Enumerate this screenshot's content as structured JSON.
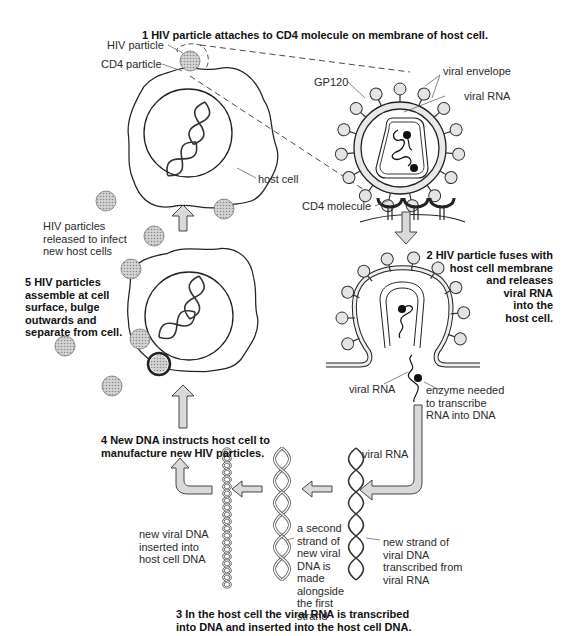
{
  "diagram": {
    "steps": {
      "s1": "1   HIV particle attaches to CD4 molecule on membrane of host cell.",
      "s2": [
        "2   HIV particle fuses with",
        "host cell membrane",
        "and releases",
        "viral RNA",
        "into the",
        "host cell."
      ],
      "s3": [
        "3   In the host cell the viral RNA is transcribed",
        "into DNA and inserted into the host cell DNA."
      ],
      "s4": [
        "4   New DNA instructs host cell to",
        "manufacture new HIV particles."
      ],
      "s5": [
        "5   HIV particles",
        "assemble at cell",
        "surface, bulge",
        "outwards and",
        "separate from cell."
      ]
    },
    "labels": {
      "hiv_particle": "HIV particle",
      "cd4_particle": "CD4 particle",
      "host_cell": "host cell",
      "viral_envelope": "viral envelope",
      "viral_rna_top": "viral RNA",
      "gp120": "GP120",
      "cd4_molecule": "CD4 molecule",
      "released": [
        "HIV particles",
        "released to infect",
        "new host cells"
      ],
      "viral_rna_fuse": "viral RNA",
      "enzyme": [
        "enzyme needed",
        "to transcribe",
        "RNA into DNA"
      ],
      "viral_rna_strand": "viral RNA",
      "new_strand": [
        "new strand of",
        "viral DNA",
        "transcribed from",
        "viral RNA"
      ],
      "second_strand": [
        "a second",
        "strand of",
        "new viral",
        "DNA is",
        "made",
        "alongside",
        "the first",
        "strand"
      ],
      "inserted": [
        "new viral DNA",
        "inserted into",
        "host cell DNA"
      ]
    },
    "colors": {
      "line": "#222222",
      "arrow_fill": "#d9d9d9",
      "particle_fill": "#bdbdbd",
      "membrane_fill": "#e6e6e6"
    }
  }
}
